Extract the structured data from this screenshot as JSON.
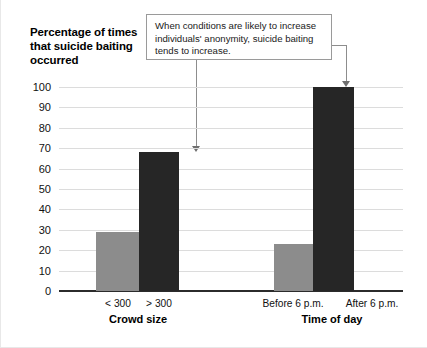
{
  "chart_data": {
    "type": "bar",
    "title": "Percentage of times that suicide baiting occurred",
    "xlabel": "",
    "ylabel": "Percentage of times that suicide baiting occurred",
    "ylim": [
      0,
      100
    ],
    "ytick_step": 10,
    "yticks": [
      100,
      90,
      80,
      70,
      60,
      50,
      40,
      30,
      20,
      10,
      0
    ],
    "grid": true,
    "legend": "none",
    "groups": [
      {
        "group_label": "Crowd size",
        "categories": [
          "< 300",
          "> 300"
        ],
        "values": [
          29,
          68
        ],
        "colors": [
          "#8c8c8c",
          "#262626"
        ]
      },
      {
        "group_label": "Time of day",
        "categories": [
          "Before 6 p.m.",
          "After 6 p.m."
        ],
        "values": [
          23,
          100
        ],
        "colors": [
          "#8c8c8c",
          "#262626"
        ]
      }
    ],
    "categories": [
      "< 300",
      "> 300",
      "Before 6 p.m.",
      "After 6 p.m."
    ],
    "values": [
      29,
      68,
      23,
      100
    ],
    "annotations": [
      {
        "text": "When conditions are likely to increase individuals' anonymity, suicide baiting tends to increase.",
        "points_to": [
          "> 300",
          "After 6 p.m."
        ]
      }
    ]
  },
  "colors": {
    "bar_light": "#8c8c8c",
    "bar_dark": "#262626",
    "gridline": "#dcdcdc",
    "axis": "#2b2b2b",
    "callout_border": "#9a9a9a",
    "leader": "#8d8d8d"
  },
  "axis_title": "Percentage of times that suicide baiting occurred",
  "callout": {
    "text": "When conditions are likely to increase individuals' anonymity, suicide baiting tends to increase."
  },
  "yticks": {
    "t100": "100",
    "t90": "90",
    "t80": "80",
    "t70": "70",
    "t60": "60",
    "t50": "50",
    "t40": "40",
    "t30": "30",
    "t20": "20",
    "t10": "10",
    "t0": "0"
  },
  "categories": {
    "c1": "< 300",
    "c2": "> 300",
    "c3": "Before 6 p.m.",
    "c4": "After 6 p.m."
  },
  "group_labels": {
    "g1": "Crowd size",
    "g2": "Time of day"
  }
}
